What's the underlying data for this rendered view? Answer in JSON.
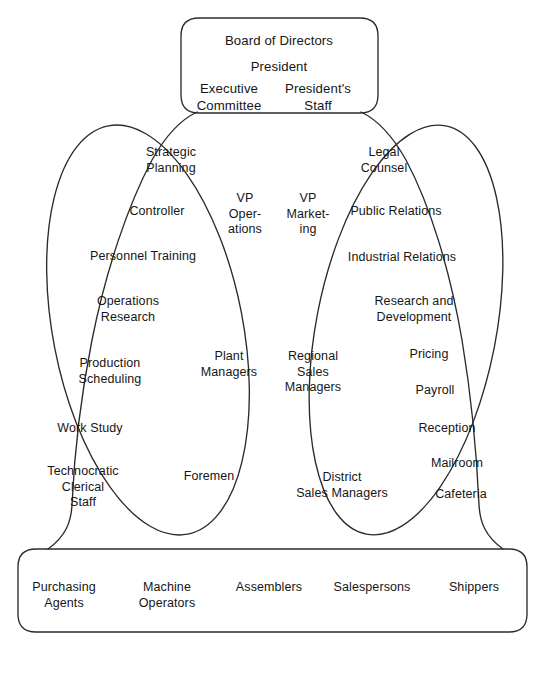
{
  "diagram": {
    "type": "organization-chart",
    "title": "",
    "shapes": {
      "top_box": "rounded-rectangle",
      "bottom_box": "rounded-rectangle",
      "left_staff_oval": "tilted-ellipse",
      "right_staff_oval": "tilted-ellipse",
      "outer_frame": "bell-curve-frame"
    },
    "line_color": "#2b2b2b"
  },
  "top_box": {
    "name": "top-management-box",
    "items": [
      {
        "label": "Board of Directors"
      },
      {
        "label": "President"
      },
      {
        "label": "Executive\nCommittee"
      },
      {
        "label": "President's\nStaff"
      }
    ]
  },
  "left_oval": {
    "name": "operations-staff-oval",
    "items": [
      {
        "label": "Strategic\nPlanning"
      },
      {
        "label": "Controller"
      },
      {
        "label": "Personnel Training"
      },
      {
        "label": "Operations\nResearch"
      },
      {
        "label": "Production\nScheduling"
      },
      {
        "label": "Work Study"
      },
      {
        "label": "Technocratic\nClerical\nStaff"
      }
    ]
  },
  "right_oval": {
    "name": "marketing-staff-oval",
    "items": [
      {
        "label": "Legal\nCounsel"
      },
      {
        "label": "Public Relations"
      },
      {
        "label": "Industrial Relations"
      },
      {
        "label": "Research and\nDevelopment"
      },
      {
        "label": "Pricing"
      },
      {
        "label": "Payroll"
      },
      {
        "label": "Reception"
      },
      {
        "label": "Mailroom"
      },
      {
        "label": "Cafeteria"
      }
    ]
  },
  "center_line": {
    "name": "middle-line-management",
    "left_column": [
      {
        "label": "VP\nOper-\nations"
      },
      {
        "label": "Plant\nManagers"
      },
      {
        "label": "Foremen"
      }
    ],
    "right_column": [
      {
        "label": "VP\nMarket-\ning"
      },
      {
        "label": "Regional\nSales\nManagers"
      },
      {
        "label": "District\nSales Managers"
      }
    ]
  },
  "bottom_box": {
    "name": "operating-core-box",
    "items": [
      {
        "label": "Purchasing\nAgents"
      },
      {
        "label": "Machine\nOperators"
      },
      {
        "label": "Assemblers"
      },
      {
        "label": "Salespersons"
      },
      {
        "label": "Shippers"
      }
    ]
  }
}
